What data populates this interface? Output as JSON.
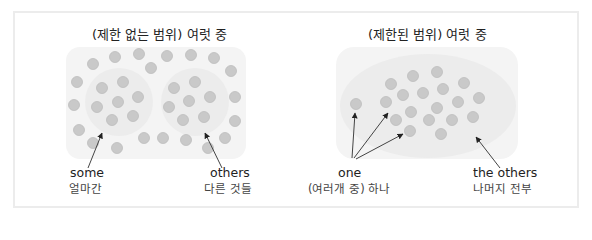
{
  "left_panel": {
    "title": "(제한 없는 범위) 여럿 중",
    "labels": {
      "some_en": "some",
      "some_ko": "얼마간",
      "others_en": "others",
      "others_ko": "다른 것들"
    }
  },
  "right_panel": {
    "title": "(제한된 범위) 여럿 중",
    "labels": {
      "one_en": "one",
      "one_ko": "(여러개 중) 하나",
      "the_others_en": "the others",
      "the_others_ko": "나머지 전부"
    }
  },
  "colors": {
    "dot": "#c6c6c6",
    "dot_stroke": "#b8b8b8",
    "panel_bg": "#f4f4f4",
    "group_bg": "#ebebeb",
    "arrow": "#333333",
    "frame": "#ececec"
  }
}
